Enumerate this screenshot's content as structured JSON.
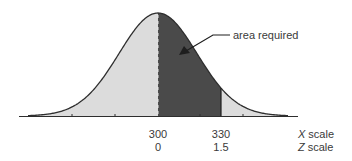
{
  "chart_data": {
    "type": "area",
    "title": "",
    "distribution": "normal",
    "mean": 300,
    "sd": 20,
    "x_scale_label": "X scale",
    "z_scale_label": "Z scale",
    "x_scale_var": "X",
    "z_scale_var": "Z",
    "scale_word": "scale",
    "ticks": [
      {
        "x": 300,
        "z": 0,
        "x_label": "300",
        "z_label": "0"
      },
      {
        "x": 330,
        "z": 1.5,
        "x_label": "330",
        "z_label": "1.5"
      }
    ],
    "shaded_region": {
      "x_from": 300,
      "x_to": 330,
      "z_from": 0,
      "z_to": 1.5
    },
    "annotation": "area required",
    "colors": {
      "curve": "#2e2e2e",
      "light_fill": "#dcdcdc",
      "dark_fill": "#4a4a4a",
      "axis": "#2e2e2e"
    }
  }
}
